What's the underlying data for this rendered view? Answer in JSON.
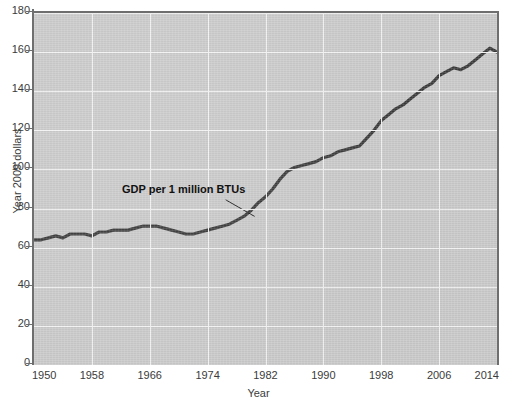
{
  "chart_data": {
    "type": "line",
    "title": "",
    "xlabel": "Year",
    "ylabel": "Year 2009 dollars",
    "xlim": [
      1950,
      2014
    ],
    "ylim": [
      0,
      180
    ],
    "grid": true,
    "legend": "none",
    "xticks": [
      "1950",
      "1958",
      "1966",
      "1974",
      "1982",
      "1990",
      "1998",
      "2006",
      "2014"
    ],
    "yticks": [
      "0",
      "20",
      "40",
      "60",
      "80",
      "100",
      "120",
      "140",
      "160",
      "180"
    ],
    "annotations": [
      {
        "text": "GDP per 1 million BTUs",
        "x": 1972,
        "y": 84
      }
    ],
    "series": [
      {
        "name": "GDP per 1 million BTUs",
        "color": "#3a3a3a",
        "x": [
          1950,
          1951,
          1952,
          1953,
          1954,
          1955,
          1956,
          1957,
          1958,
          1959,
          1960,
          1961,
          1962,
          1963,
          1964,
          1965,
          1966,
          1967,
          1968,
          1969,
          1970,
          1971,
          1972,
          1973,
          1974,
          1975,
          1976,
          1977,
          1978,
          1979,
          1980,
          1981,
          1982,
          1983,
          1984,
          1985,
          1986,
          1987,
          1988,
          1989,
          1990,
          1991,
          1992,
          1993,
          1994,
          1995,
          1996,
          1997,
          1998,
          1999,
          2000,
          2001,
          2002,
          2003,
          2004,
          2005,
          2006,
          2007,
          2008,
          2009,
          2010,
          2011,
          2012,
          2013,
          2014
        ],
        "values": [
          64,
          64,
          65,
          66,
          65,
          67,
          67,
          67,
          66,
          68,
          68,
          69,
          69,
          69,
          70,
          71,
          71,
          71,
          70,
          69,
          68,
          67,
          67,
          68,
          69,
          70,
          71,
          72,
          74,
          76,
          79,
          83,
          86,
          90,
          95,
          99,
          101,
          102,
          103,
          104,
          106,
          107,
          109,
          110,
          111,
          112,
          116,
          120,
          125,
          128,
          131,
          133,
          136,
          139,
          142,
          144,
          148,
          150,
          152,
          151,
          153,
          156,
          159,
          162,
          160
        ]
      }
    ]
  }
}
